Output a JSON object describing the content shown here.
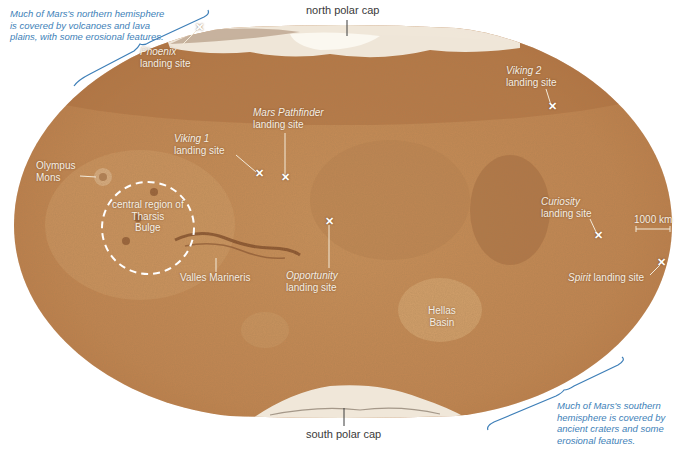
{
  "map": {
    "subject": "Mars global map (elliptical projection)",
    "colors": {
      "surface_base": "#c48a52",
      "surface_light": "#d6a36c",
      "surface_dark": "#9a5f30",
      "polar_cap": "#f2ece0",
      "label_text": "#f6efe4",
      "annotation_blue": "#3e7fb8",
      "polar_label": "#3a3a3a"
    },
    "polar_labels": {
      "north": "north polar cap",
      "south": "south polar cap"
    },
    "notes": {
      "north": "Much of Mars's northern hemisphere is covered by volcanoes and lava plains, with some erosional features.",
      "north_lines": [
        "Much of Mars's northern hemisphere",
        "is covered by volcanoes and lava",
        "plains, with some erosional features."
      ],
      "south": "Much of Mars's southern hemisphere is covered by ancient craters and some erosional features.",
      "south_lines": [
        "Much of Mars's southern",
        "hemisphere is covered by",
        "ancient craters and some",
        "erosional features."
      ]
    },
    "landing_sites": [
      {
        "name": "Phoenix",
        "suffix": "landing site",
        "x": 199,
        "y": 28
      },
      {
        "name": "Viking 2",
        "suffix": "landing site",
        "x": 552,
        "y": 107
      },
      {
        "name": "Mars Pathfinder",
        "suffix": "landing site",
        "x": 285,
        "y": 178
      },
      {
        "name": "Viking 1",
        "suffix": "landing site",
        "x": 259,
        "y": 174
      },
      {
        "name": "Opportunity",
        "suffix": "landing site",
        "x": 329,
        "y": 222
      },
      {
        "name": "Curiosity",
        "suffix": "landing site",
        "x": 598,
        "y": 236
      },
      {
        "name": "Spirit",
        "suffix": "landing site",
        "x": 661,
        "y": 263
      }
    ],
    "features": [
      {
        "name": "Olympus Mons",
        "lines": [
          "Olympus",
          "Mons"
        ]
      },
      {
        "name": "central region of Tharsis Bulge",
        "lines": [
          "central region of",
          "Tharsis",
          "Bulge"
        ]
      },
      {
        "name": "Valles Marineris",
        "lines": [
          "Valles Marineris"
        ]
      },
      {
        "name": "Hellas Basin",
        "lines": [
          "Hellas",
          "Basin"
        ]
      }
    ],
    "scale_bar": {
      "label": "1000 km"
    },
    "x_symbol": "✕"
  }
}
